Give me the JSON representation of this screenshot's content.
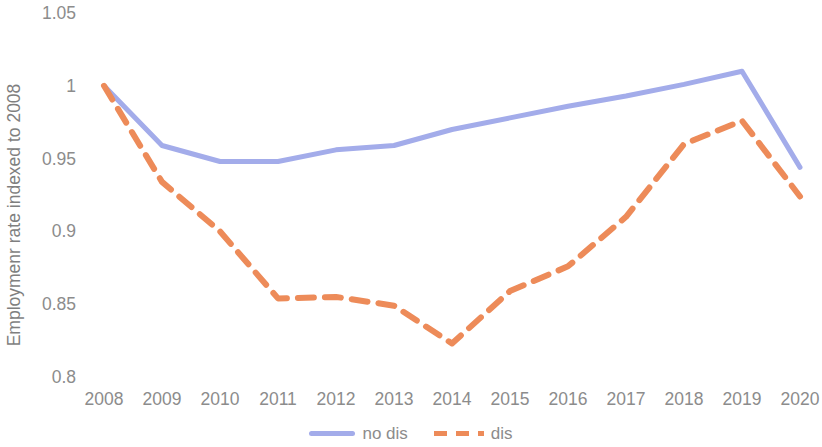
{
  "chart_data": {
    "type": "line",
    "title": "",
    "xlabel": "",
    "ylabel": "Employmenr rate indexed to 2008",
    "x": [
      2008,
      2009,
      2010,
      2011,
      2012,
      2013,
      2014,
      2015,
      2016,
      2017,
      2018,
      2019,
      2020
    ],
    "categories": [
      "2008",
      "2009",
      "2010",
      "2011",
      "2012",
      "2013",
      "2014",
      "2015",
      "2016",
      "2017",
      "2018",
      "2019",
      "2020"
    ],
    "series": [
      {
        "name": "no dis",
        "color": "#A3ACEA",
        "style": "solid",
        "values": [
          1.0,
          0.959,
          0.948,
          0.948,
          0.956,
          0.959,
          0.97,
          0.978,
          0.986,
          0.993,
          1.001,
          1.01,
          0.944
        ]
      },
      {
        "name": "dis",
        "color": "#ED8B59",
        "style": "dashed",
        "values": [
          1.0,
          0.934,
          0.9,
          0.854,
          0.855,
          0.849,
          0.823,
          0.859,
          0.876,
          0.91,
          0.96,
          0.976,
          0.924
        ]
      }
    ],
    "ylim": [
      0.8,
      1.05
    ],
    "yticks": [
      1.05,
      1,
      0.95,
      0.9,
      0.85,
      0.8
    ],
    "ytick_labels": [
      "1.05",
      "1",
      "0.95",
      "0.9",
      "0.85",
      "0.8"
    ],
    "xlim": [
      2008,
      2020
    ],
    "grid": false,
    "legend_position": "bottom",
    "legend": [
      "no dis",
      "dis"
    ]
  },
  "axes": {
    "y_title": "Employmenr rate indexed to 2008",
    "y_tick_labels": [
      "1.05",
      "1",
      "0.95",
      "0.9",
      "0.85",
      "0.8"
    ],
    "x_tick_labels": [
      "2008",
      "2009",
      "2010",
      "2011",
      "2012",
      "2013",
      "2014",
      "2015",
      "2016",
      "2017",
      "2018",
      "2019",
      "2020"
    ]
  },
  "legend": {
    "entries": [
      {
        "label": "no dis",
        "color": "#A3ACEA",
        "style": "solid"
      },
      {
        "label": "dis",
        "color": "#ED8B59",
        "style": "dashed"
      }
    ]
  },
  "colors": {
    "series_no_dis": "#A3ACEA",
    "series_dis": "#ED8B59",
    "text": "#8C8C8C",
    "background": "#FFFFFF"
  }
}
